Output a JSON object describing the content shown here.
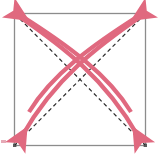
{
  "figure": {
    "title": "Fold diagram: square with two dashed diagonals and four curved fold arrows",
    "type": "origami-fold-diagram",
    "caption": ""
  },
  "canvas": {
    "width": 160,
    "height": 162,
    "background_color": "#ffffff"
  },
  "square": {
    "name": "paper-square",
    "left": 14,
    "top": 13,
    "right": 146,
    "bottom": 146,
    "fill_color": "#ffffff",
    "border_color": "#8c8c8c",
    "border_width": 1.3,
    "corner_marker_color": "#5a5a5a"
  },
  "creases": [
    {
      "name": "diagonal-crease-tl-br",
      "from": "top-left",
      "to": "bottom-right",
      "style": "dashed",
      "color": "#2b2b2b",
      "dash": "4 3",
      "width": 1.2
    },
    {
      "name": "diagonal-crease-tr-bl",
      "from": "top-right",
      "to": "bottom-left",
      "style": "dashed",
      "color": "#2b2b2b",
      "dash": "4 3",
      "width": 1.2
    }
  ],
  "arrows": {
    "color": "#e0697f",
    "stroke_width": 4.2,
    "count": 4,
    "items": [
      {
        "name": "fold-arrow-tl-to-br-inner",
        "from": "top-left",
        "to": "bottom-right",
        "head_direction": "up-left",
        "bulge": "above-diagonal"
      },
      {
        "name": "fold-arrow-tl-to-br-outer",
        "from": "top-left",
        "to": "bottom-right",
        "head_direction": "down-right",
        "bulge": "above-diagonal"
      },
      {
        "name": "fold-arrow-tr-to-bl-inner",
        "from": "top-right",
        "to": "bottom-left",
        "head_direction": "up-right",
        "bulge": "above-diagonal"
      },
      {
        "name": "fold-arrow-tr-to-bl-outer",
        "from": "top-right",
        "to": "bottom-left",
        "head_direction": "down-left",
        "bulge": "above-diagonal"
      }
    ]
  },
  "edge_artifact": {
    "name": "left-edge-artifact",
    "color": "#e6a9b6",
    "x": 1,
    "y": 140,
    "width": 5,
    "height": 3
  }
}
